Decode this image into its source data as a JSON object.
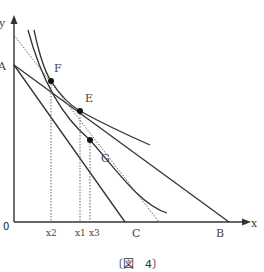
{
  "diagram": {
    "type": "indifference-curve-budget-line",
    "axes": {
      "x_label": "x",
      "y_label": "y",
      "origin_label": "0"
    },
    "points": {
      "A": "A",
      "B": "B",
      "C": "C",
      "E": "E",
      "F": "F",
      "G": "G"
    },
    "x_ticks": {
      "x2": "x2",
      "x1": "x1",
      "x3": "x3"
    },
    "caption": "〔図　4〕"
  },
  "colors": {
    "line": "#333333",
    "dotted": "#666666"
  }
}
